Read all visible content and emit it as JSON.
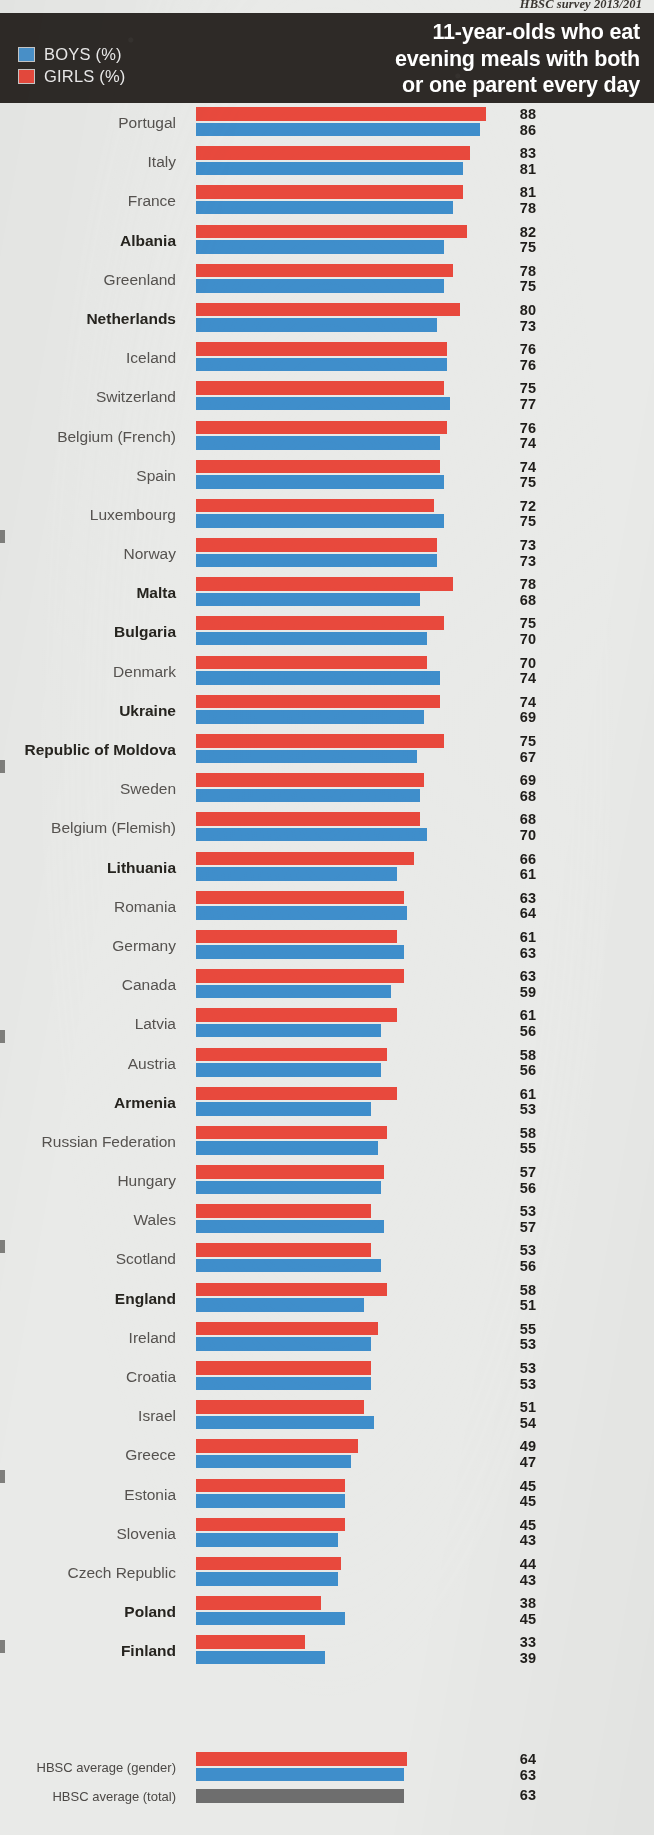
{
  "source_note": "HBSC survey 2013/201",
  "header": {
    "title_lines": [
      "11-year-olds who eat",
      "evening meals with both",
      "or one parent every day"
    ],
    "legend": [
      {
        "label": "BOYS (%)",
        "color": "#4a93cc",
        "key": "boys"
      },
      {
        "label": "GIRLS (%)",
        "color": "#e8493d",
        "key": "girls"
      }
    ],
    "background_color": "#2e2a27"
  },
  "colors": {
    "girls": "#e8493d",
    "boys": "#3f8ecb",
    "total": "#6e6e6e",
    "page_background": "#e9eae8",
    "header_background": "#2e2a27",
    "label_text": "#55524f",
    "value_text": "#1f1d1a"
  },
  "averages": {
    "gender_label": "HBSC average (gender)",
    "gender_girls": 64,
    "gender_boys": 63,
    "total_label": "HBSC average (total)",
    "total_value": 63
  },
  "chart_data": {
    "type": "bar",
    "orientation": "horizontal",
    "title": "11-year-olds who eat evening meals with both or one parent every day",
    "subtitle": "HBSC survey 2013/201",
    "xlabel": "",
    "ylabel": "",
    "xlim": [
      0,
      100
    ],
    "grid": false,
    "legend_position": "top-left",
    "value_unit": "%",
    "categories": [
      "Portugal",
      "Italy",
      "France",
      "Albania",
      "Greenland",
      "Netherlands",
      "Iceland",
      "Switzerland",
      "Belgium (French)",
      "Spain",
      "Luxembourg",
      "Norway",
      "Malta",
      "Bulgaria",
      "Denmark",
      "Ukraine",
      "Republic of Moldova",
      "Sweden",
      "Belgium (Flemish)",
      "Lithuania",
      "Romania",
      "Germany",
      "Canada",
      "Latvia",
      "Austria",
      "Armenia",
      "Russian Federation",
      "Hungary",
      "Wales",
      "Scotland",
      "England",
      "Ireland",
      "Croatia",
      "Israel",
      "Greece",
      "Estonia",
      "Slovenia",
      "Czech Republic",
      "Poland",
      "Finland"
    ],
    "bold_categories": [
      "Albania",
      "Netherlands",
      "Malta",
      "Bulgaria",
      "Ukraine",
      "Republic of Moldova",
      "Lithuania",
      "Armenia",
      "England",
      "Poland",
      "Finland"
    ],
    "series": [
      {
        "name": "GIRLS (%)",
        "color": "#e8493d",
        "values": [
          88,
          83,
          81,
          82,
          78,
          80,
          76,
          75,
          76,
          74,
          72,
          73,
          78,
          75,
          70,
          74,
          75,
          69,
          68,
          66,
          63,
          61,
          63,
          61,
          58,
          61,
          58,
          57,
          53,
          53,
          58,
          55,
          53,
          51,
          49,
          45,
          45,
          44,
          38,
          33
        ]
      },
      {
        "name": "BOYS (%)",
        "color": "#3f8ecb",
        "values": [
          86,
          81,
          78,
          75,
          75,
          73,
          76,
          77,
          74,
          75,
          75,
          73,
          68,
          70,
          74,
          69,
          67,
          68,
          70,
          61,
          64,
          63,
          59,
          56,
          56,
          53,
          55,
          56,
          57,
          56,
          51,
          53,
          53,
          54,
          47,
          45,
          43,
          43,
          45,
          39
        ]
      }
    ],
    "annotations": [
      {
        "label": "HBSC average (gender)",
        "girls": 64,
        "boys": 63
      },
      {
        "label": "HBSC average (total)",
        "total": 63
      }
    ]
  }
}
